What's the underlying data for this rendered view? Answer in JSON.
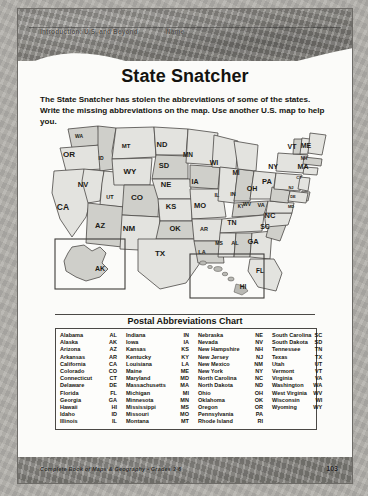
{
  "header": {
    "left_text": "Introduction: U.S. and Beyond",
    "name_label": "Name"
  },
  "title": "State Snatcher",
  "instructions": "The State Snatcher has stolen the abbreviations of some of the states. Write the missing abbreviations on the map. Use another U.S. map to help you.",
  "map": {
    "insets": [
      {
        "name": "alaska-inset",
        "label": "AK"
      },
      {
        "name": "hawaii-inset",
        "label": "HI"
      }
    ],
    "labels": [
      {
        "abbr": "WA",
        "x": 37,
        "y": 17,
        "size": 5
      },
      {
        "abbr": "OR",
        "x": 27,
        "y": 36,
        "size": 8
      },
      {
        "abbr": "ID",
        "x": 59,
        "y": 39,
        "size": 5
      },
      {
        "abbr": "MT",
        "x": 84,
        "y": 27,
        "size": 6
      },
      {
        "abbr": "ND",
        "x": 120,
        "y": 26,
        "size": 7.5
      },
      {
        "abbr": "SD",
        "x": 122,
        "y": 47,
        "size": 7.5
      },
      {
        "abbr": "WY",
        "x": 88,
        "y": 53,
        "size": 8
      },
      {
        "abbr": "NV",
        "x": 41,
        "y": 66,
        "size": 7.5
      },
      {
        "abbr": "UT",
        "x": 68,
        "y": 78,
        "size": 5.5
      },
      {
        "abbr": "CO",
        "x": 95,
        "y": 79,
        "size": 8
      },
      {
        "abbr": "NE",
        "x": 124,
        "y": 66,
        "size": 7.5
      },
      {
        "abbr": "IA",
        "x": 153,
        "y": 63,
        "size": 7
      },
      {
        "abbr": "MN",
        "x": 146,
        "y": 36,
        "size": 6.5
      },
      {
        "abbr": "WI",
        "x": 172,
        "y": 44,
        "size": 7
      },
      {
        "abbr": "MI",
        "x": 194,
        "y": 54,
        "size": 6.5
      },
      {
        "abbr": "CA",
        "x": 21,
        "y": 89,
        "size": 8.5
      },
      {
        "abbr": "AZ",
        "x": 58,
        "y": 107,
        "size": 7.5
      },
      {
        "abbr": "NM",
        "x": 87,
        "y": 110,
        "size": 8
      },
      {
        "abbr": "KS",
        "x": 129,
        "y": 88,
        "size": 7.5
      },
      {
        "abbr": "MO",
        "x": 158,
        "y": 87,
        "size": 7.5
      },
      {
        "abbr": "IL",
        "x": 175,
        "y": 76,
        "size": 5.5
      },
      {
        "abbr": "IN",
        "x": 191,
        "y": 75,
        "size": 5.5
      },
      {
        "abbr": "OH",
        "x": 210,
        "y": 70,
        "size": 7
      },
      {
        "abbr": "KY",
        "x": 199,
        "y": 87,
        "size": 4.5
      },
      {
        "abbr": "OK",
        "x": 133,
        "y": 110,
        "size": 7.5
      },
      {
        "abbr": "AR",
        "x": 162,
        "y": 110,
        "size": 5.5
      },
      {
        "abbr": "TN",
        "x": 190,
        "y": 104,
        "size": 7
      },
      {
        "abbr": "TX",
        "x": 118,
        "y": 135,
        "size": 8
      },
      {
        "abbr": "LA",
        "x": 160,
        "y": 133,
        "size": 5.5
      },
      {
        "abbr": "MS",
        "x": 177,
        "y": 124,
        "size": 5
      },
      {
        "abbr": "AL",
        "x": 193,
        "y": 124,
        "size": 5.5
      },
      {
        "abbr": "GA",
        "x": 211,
        "y": 123,
        "size": 7.5
      },
      {
        "abbr": "SC",
        "x": 223,
        "y": 108,
        "size": 7
      },
      {
        "abbr": "NC",
        "x": 228,
        "y": 97,
        "size": 7.5
      },
      {
        "abbr": "VA",
        "x": 219,
        "y": 86,
        "size": 5.5
      },
      {
        "abbr": "WV",
        "x": 205,
        "y": 85,
        "size": 5
      },
      {
        "abbr": "PA",
        "x": 225,
        "y": 63,
        "size": 7.5
      },
      {
        "abbr": "NY",
        "x": 231,
        "y": 48,
        "size": 7
      },
      {
        "abbr": "VT",
        "x": 250,
        "y": 28,
        "size": 7
      },
      {
        "abbr": "ME",
        "x": 264,
        "y": 27,
        "size": 7
      },
      {
        "abbr": "NH",
        "x": 262,
        "y": 39,
        "size": 4.5
      },
      {
        "abbr": "MA",
        "x": 261,
        "y": 48,
        "size": 7
      },
      {
        "abbr": "CT",
        "x": 257,
        "y": 58,
        "size": 4
      },
      {
        "abbr": "NJ",
        "x": 249,
        "y": 68,
        "size": 4
      },
      {
        "abbr": "DE",
        "x": 251,
        "y": 77,
        "size": 4
      },
      {
        "abbr": "MD",
        "x": 249,
        "y": 87,
        "size": 4
      },
      {
        "abbr": "FL",
        "x": 218,
        "y": 152,
        "size": 6.5
      }
    ]
  },
  "chart": {
    "title": "Postal Abbreviations Chart",
    "columns": [
      [
        {
          "state": "Alabama",
          "abbr": "AL"
        },
        {
          "state": "Alaska",
          "abbr": "AK"
        },
        {
          "state": "Arizona",
          "abbr": "AZ"
        },
        {
          "state": "Arkansas",
          "abbr": "AR"
        },
        {
          "state": "California",
          "abbr": "CA"
        },
        {
          "state": "Colorado",
          "abbr": "CO"
        },
        {
          "state": "Connecticut",
          "abbr": "CT"
        },
        {
          "state": "Delaware",
          "abbr": "DE"
        },
        {
          "state": "Florida",
          "abbr": "FL"
        },
        {
          "state": "Georgia",
          "abbr": "GA"
        },
        {
          "state": "Hawaii",
          "abbr": "HI"
        },
        {
          "state": "Idaho",
          "abbr": "ID"
        },
        {
          "state": "Illinois",
          "abbr": "IL"
        }
      ],
      [
        {
          "state": "Indiana",
          "abbr": "IN"
        },
        {
          "state": "Iowa",
          "abbr": "IA"
        },
        {
          "state": "Kansas",
          "abbr": "KS"
        },
        {
          "state": "Kentucky",
          "abbr": "KY"
        },
        {
          "state": "Louisiana",
          "abbr": "LA"
        },
        {
          "state": "Maine",
          "abbr": "ME"
        },
        {
          "state": "Maryland",
          "abbr": "MD"
        },
        {
          "state": "Massachusetts",
          "abbr": "MA"
        },
        {
          "state": "Michigan",
          "abbr": "MI"
        },
        {
          "state": "Minnesota",
          "abbr": "MN"
        },
        {
          "state": "Mississippi",
          "abbr": "MS"
        },
        {
          "state": "Missouri",
          "abbr": "MO"
        },
        {
          "state": "Montana",
          "abbr": "MT"
        }
      ],
      [
        {
          "state": "Nebraska",
          "abbr": "NE"
        },
        {
          "state": "Nevada",
          "abbr": "NV"
        },
        {
          "state": "New Hampshire",
          "abbr": "NH"
        },
        {
          "state": "New Jersey",
          "abbr": "NJ"
        },
        {
          "state": "New Mexico",
          "abbr": "NM"
        },
        {
          "state": "New York",
          "abbr": "NY"
        },
        {
          "state": "North Carolina",
          "abbr": "NC"
        },
        {
          "state": "North Dakota",
          "abbr": "ND"
        },
        {
          "state": "Ohio",
          "abbr": "OH"
        },
        {
          "state": "Oklahoma",
          "abbr": "OK"
        },
        {
          "state": "Oregon",
          "abbr": "OR"
        },
        {
          "state": "Pennsylvania",
          "abbr": "PA"
        },
        {
          "state": "Rhode Island",
          "abbr": "RI"
        }
      ],
      [
        {
          "state": "South Carolina",
          "abbr": "SC"
        },
        {
          "state": "South Dakota",
          "abbr": "SD"
        },
        {
          "state": "Tennessee",
          "abbr": "TN"
        },
        {
          "state": "Texas",
          "abbr": "TX"
        },
        {
          "state": "Utah",
          "abbr": "UT"
        },
        {
          "state": "Vermont",
          "abbr": "VT"
        },
        {
          "state": "Virginia",
          "abbr": "VA"
        },
        {
          "state": "Washington",
          "abbr": "WA"
        },
        {
          "state": "West Virginia",
          "abbr": "WV"
        },
        {
          "state": "Wisconsin",
          "abbr": "WI"
        },
        {
          "state": "Wyoming",
          "abbr": "WY"
        }
      ]
    ]
  },
  "footer": {
    "credit": "Complete Book of Maps & Geography • Grades 3-6",
    "page": "103"
  },
  "colors": {
    "band": "#8e8c87",
    "paper": "#fbfbf9",
    "ink": "#16150f",
    "state_fill": "#cfcfca",
    "state_fill_alt": "#e3e3df",
    "state_stroke": "#4a4845"
  }
}
